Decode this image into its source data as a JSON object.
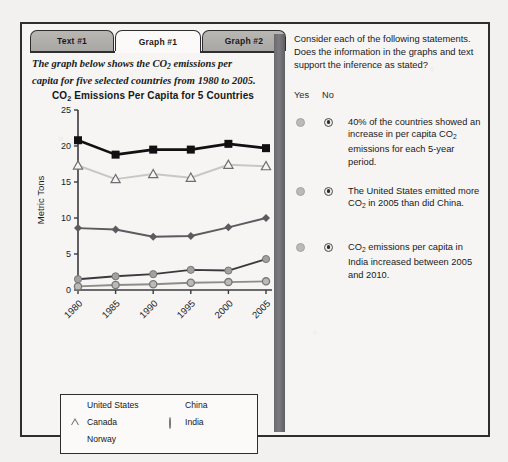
{
  "tabs": [
    {
      "label": "Text #1",
      "active": false
    },
    {
      "label": "Graph #1",
      "active": true
    },
    {
      "label": "Graph #2",
      "active": false
    }
  ],
  "intro": {
    "line1_a": "The graph below shows the CO",
    "line1_sub": "2",
    "line1_b": " emissions per",
    "line2": "capita for five selected countries from 1980 to 2005."
  },
  "chart_title": {
    "a": "CO",
    "sub": "2",
    "b": " Emissions Per Capita for 5 Countries"
  },
  "legend": [
    {
      "label": "United States",
      "marker": "filled-square"
    },
    {
      "label": "Canada",
      "marker": "open-triangle"
    },
    {
      "label": "Norway",
      "marker": "dark-diamond"
    },
    {
      "label": "China",
      "marker": "gray-circle"
    },
    {
      "label": "India",
      "marker": "ringed-circle"
    }
  ],
  "right": {
    "prompt": "Consider each of the following statements. Does the information in the graphs and text support the inference as stated?",
    "yes_label": "Yes",
    "no_label": "No",
    "statements": [
      {
        "parts": [
          {
            "t": "40% of the countries showed an increase in per capita CO"
          },
          {
            "t": "2",
            "sub": true
          },
          {
            "t": " emissions for each 5-year period."
          }
        ],
        "selected": "no"
      },
      {
        "parts": [
          {
            "t": "The United States emitted more CO"
          },
          {
            "t": "2",
            "sub": true
          },
          {
            "t": " in 2005 than did China."
          }
        ],
        "selected": "no"
      },
      {
        "parts": [
          {
            "t": "CO"
          },
          {
            "t": "2",
            "sub": true
          },
          {
            "t": " emissions per capita in India increased between 2005 and 2010."
          }
        ],
        "selected": "no"
      }
    ]
  },
  "chart_data": {
    "type": "line",
    "title": "CO2 Emissions Per Capita for 5 Countries",
    "xlabel": "",
    "ylabel": "Metric Tons",
    "categories": [
      "1980",
      "1985",
      "1990",
      "1995",
      "2000",
      "2005"
    ],
    "yticks": [
      0,
      5,
      10,
      15,
      20,
      25
    ],
    "ylim": [
      0,
      25
    ],
    "grid": false,
    "legend_position": "below-plot",
    "series": [
      {
        "name": "United States",
        "marker": "filled-square",
        "color": "#111113",
        "values": [
          20.8,
          18.8,
          19.5,
          19.5,
          20.3,
          19.7
        ]
      },
      {
        "name": "Canada",
        "marker": "open-triangle",
        "color": "#c9c7c4",
        "values": [
          17.3,
          15.4,
          16.1,
          15.6,
          17.4,
          17.2
        ]
      },
      {
        "name": "Norway",
        "marker": "dark-diamond",
        "color": "#5b5b60",
        "values": [
          8.6,
          8.4,
          7.4,
          7.5,
          8.7,
          10.0
        ]
      },
      {
        "name": "China",
        "marker": "gray-circle",
        "color": "#3a3a3e",
        "values": [
          1.5,
          1.9,
          2.2,
          2.8,
          2.7,
          4.3
        ]
      },
      {
        "name": "India",
        "marker": "ringed-circle",
        "color": "#8e8c89",
        "values": [
          0.5,
          0.7,
          0.8,
          1.0,
          1.1,
          1.2
        ]
      }
    ]
  }
}
